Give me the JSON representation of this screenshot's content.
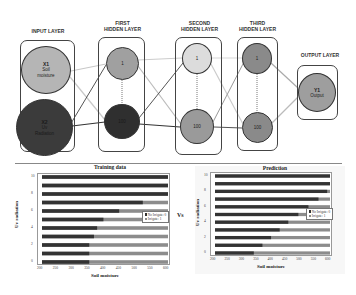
{
  "diagram": {
    "layers": [
      {
        "label": "INPUT LAYER",
        "nodes": [
          {
            "id": "X1",
            "text": "Soil moisture"
          },
          {
            "id": "X2",
            "text": "Uv Radiation"
          }
        ]
      },
      {
        "label": "FIRST HIDDEN LAYER",
        "nodes": [
          {
            "id": "1"
          },
          {
            "id": "100"
          }
        ]
      },
      {
        "label": "SECOND HIDDEN LAYER",
        "nodes": [
          {
            "id": "1"
          },
          {
            "id": "100"
          }
        ]
      },
      {
        "label": "THIRD HIDDEN LAYER",
        "nodes": [
          {
            "id": "1"
          },
          {
            "id": "100"
          }
        ]
      },
      {
        "label": "OUTPUT LAYER",
        "nodes": [
          {
            "id": "Y1",
            "text": "Output"
          }
        ]
      }
    ],
    "labels": {
      "input": "INPUT LAYER",
      "first_1": "FIRST",
      "first_2": "HIDDEN LAYER",
      "second_1": "SECOND",
      "second_2": "HIDDEN LAYER",
      "third_1": "THIRD",
      "third_2": "HIDDEN LAYER",
      "output": "OUTPUT LAYER"
    },
    "nodes": {
      "x1_id": "X1",
      "x1_line1": "Soil",
      "x1_line2": "moisture",
      "x2_id": "X2",
      "x2_line1": "Uv",
      "x2_line2": "Radiation",
      "h1_top": "1",
      "h1_bottom": "100",
      "h2_top": "1",
      "h2_bottom": "100",
      "h3_top": "1",
      "h3_bottom": "100",
      "y1_id": "Y1",
      "y1_line1": "Output"
    },
    "colors": {
      "x1": "#b5b5b5",
      "x2": "#3b3b3b",
      "h1_top": "#a0a0a0",
      "h1_bottom": "#2f2f2f",
      "h2_top": "#dcdcdc",
      "h2_bottom": "#9a9a9a",
      "h3_top": "#8a8a8a",
      "h3_bottom": "#8a8a8a",
      "y1": "#9e9e9e"
    },
    "vs_label": "Vs"
  },
  "chart_data": [
    {
      "type": "bar",
      "orientation": "horizontal-stacked",
      "title": "Training data",
      "xlabel": "Soil moisture",
      "ylabel": "Uv radiation",
      "xlim": [
        200,
        600
      ],
      "x_ticks": [
        "200",
        "250",
        "300",
        "350",
        "400",
        "450",
        "500",
        "550",
        "600"
      ],
      "y_ticks": [
        "0",
        "2",
        "4",
        "6",
        "8",
        "10"
      ],
      "categories": [
        0,
        1,
        2,
        3,
        4,
        5,
        6,
        7,
        8,
        9,
        10
      ],
      "legend": [
        "No Irrigate: 0",
        "Irrigate: 1"
      ],
      "legend_position": "right",
      "series": [
        {
          "name": "No Irrigate: 0",
          "color": "#333333",
          "end_x": [
            350,
            350,
            350,
            365,
            375,
            395,
            445,
            520,
            600,
            600,
            600
          ]
        },
        {
          "name": "Irrigate: 1",
          "color": "#8c8c8c",
          "end_x": [
            600,
            600,
            600,
            600,
            600,
            600,
            600,
            600,
            600,
            600,
            600
          ]
        }
      ]
    },
    {
      "type": "bar",
      "orientation": "horizontal-stacked",
      "title": "Prediction",
      "xlabel": "Soil moisture",
      "ylabel": "Uv radiation",
      "xlim": [
        200,
        600
      ],
      "x_ticks": [
        "200",
        "250",
        "300",
        "350",
        "400",
        "450",
        "500",
        "550",
        "600"
      ],
      "y_ticks": [
        "0",
        "2",
        "4",
        "6",
        "8",
        "10"
      ],
      "categories": [
        0,
        1,
        2,
        3,
        4,
        5,
        6,
        7,
        8,
        9,
        10
      ],
      "legend": [
        "No Irrigate: 0",
        "Irrigate: 1"
      ],
      "legend_position": "right",
      "series": [
        {
          "name": "No Irrigate: 0",
          "color": "#333333",
          "end_x": [
            335,
            365,
            395,
            425,
            455,
            490,
            525,
            560,
            590,
            600,
            600
          ]
        },
        {
          "name": "Irrigate: 1",
          "color": "#8c8c8c",
          "end_x": [
            600,
            600,
            600,
            600,
            600,
            600,
            600,
            600,
            600,
            600,
            600
          ]
        }
      ]
    }
  ],
  "charts": {
    "training": {
      "title": "Training data",
      "xlabel": "Soil moisture",
      "ylabel": "Uv radiation",
      "legend0": "No Irrigate: 0",
      "legend1": "Irrigate: 1"
    },
    "prediction": {
      "title": "Prediction",
      "xlabel": "Soil moisture",
      "ylabel": "Uv radiation",
      "legend0": "No Irrigate: 0",
      "legend1": "Irrigate: 1"
    }
  }
}
